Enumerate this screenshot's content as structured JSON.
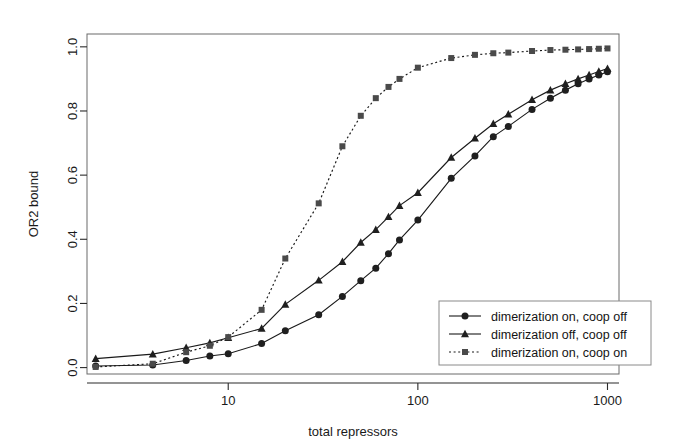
{
  "figure": {
    "background": "#ffffff",
    "ink": "#1a1a1a"
  },
  "chart_data": {
    "type": "line",
    "title": "",
    "xlabel": "total repressors",
    "ylabel": "OR2 bound",
    "xscale": "log",
    "yscale": "linear",
    "xlim": [
      1.8,
      1150
    ],
    "ylim": [
      -0.02,
      1.04
    ],
    "xticks": [
      10,
      100,
      1000
    ],
    "xtick_labels": [
      "10",
      "100",
      "1000"
    ],
    "yticks": [
      0.0,
      0.2,
      0.4,
      0.6,
      0.8,
      1.0
    ],
    "ytick_labels": [
      "0.0",
      "0.2",
      "0.4",
      "0.6",
      "0.8",
      "1.0"
    ],
    "grid": false,
    "legend_position": "bottom-right",
    "series": [
      {
        "name": "dimerization on, coop off",
        "marker": "circle",
        "linestyle": "solid",
        "color": "#1f1f1f",
        "x": [
          2,
          4,
          6,
          8,
          10,
          15,
          20,
          30,
          40,
          50,
          60,
          70,
          80,
          100,
          150,
          200,
          250,
          300,
          400,
          500,
          600,
          700,
          800,
          900,
          1000
        ],
        "values": [
          0.005,
          0.008,
          0.022,
          0.036,
          0.043,
          0.075,
          0.115,
          0.165,
          0.222,
          0.271,
          0.31,
          0.355,
          0.398,
          0.46,
          0.59,
          0.66,
          0.72,
          0.752,
          0.805,
          0.84,
          0.865,
          0.885,
          0.9,
          0.912,
          0.922
        ]
      },
      {
        "name": "dimerization off, coop off",
        "marker": "triangle",
        "linestyle": "solid",
        "color": "#1f1f1f",
        "x": [
          2,
          4,
          6,
          8,
          10,
          15,
          20,
          30,
          40,
          50,
          60,
          70,
          80,
          100,
          150,
          200,
          250,
          300,
          400,
          500,
          600,
          700,
          800,
          900,
          1000
        ],
        "values": [
          0.028,
          0.042,
          0.062,
          0.077,
          0.093,
          0.122,
          0.197,
          0.272,
          0.33,
          0.39,
          0.43,
          0.47,
          0.505,
          0.545,
          0.655,
          0.715,
          0.76,
          0.79,
          0.835,
          0.865,
          0.885,
          0.9,
          0.912,
          0.923,
          0.932
        ]
      },
      {
        "name": "dimerization on, coop on",
        "marker": "square",
        "linestyle": "dotted",
        "color": "#4a4a4a",
        "x": [
          2,
          4,
          6,
          8,
          10,
          15,
          20,
          30,
          40,
          50,
          60,
          70,
          80,
          100,
          150,
          200,
          250,
          300,
          400,
          500,
          600,
          700,
          800,
          900,
          1000
        ],
        "values": [
          0.002,
          0.012,
          0.048,
          0.068,
          0.095,
          0.18,
          0.34,
          0.512,
          0.69,
          0.785,
          0.84,
          0.875,
          0.9,
          0.935,
          0.965,
          0.975,
          0.98,
          0.982,
          0.987,
          0.99,
          0.991,
          0.992,
          0.993,
          0.994,
          0.995
        ]
      }
    ]
  }
}
